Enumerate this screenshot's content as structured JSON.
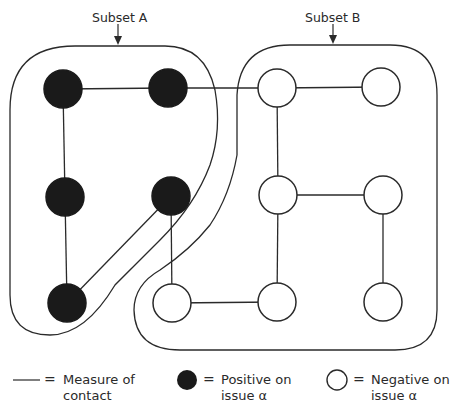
{
  "labels": {
    "subset_a": "Subset A",
    "subset_b": "Subset B"
  },
  "nodes": [
    {
      "id": 1,
      "x": 63,
      "y": 89,
      "state": "positive",
      "subset": "A"
    },
    {
      "id": 2,
      "x": 168,
      "y": 88,
      "state": "positive",
      "subset": "A"
    },
    {
      "id": 3,
      "x": 277,
      "y": 88,
      "state": "negative",
      "subset": "B"
    },
    {
      "id": 4,
      "x": 381,
      "y": 87,
      "state": "negative",
      "subset": "B"
    },
    {
      "id": 5,
      "x": 65,
      "y": 197,
      "state": "positive",
      "subset": "A"
    },
    {
      "id": 6,
      "x": 171,
      "y": 196,
      "state": "positive",
      "subset": "A"
    },
    {
      "id": 7,
      "x": 278,
      "y": 195,
      "state": "negative",
      "subset": "B"
    },
    {
      "id": 8,
      "x": 383,
      "y": 195,
      "state": "negative",
      "subset": "B"
    },
    {
      "id": 9,
      "x": 67,
      "y": 303,
      "state": "positive",
      "subset": "A"
    },
    {
      "id": 10,
      "x": 172,
      "y": 303,
      "state": "negative",
      "subset": "B"
    },
    {
      "id": 11,
      "x": 277,
      "y": 302,
      "state": "negative",
      "subset": "B"
    },
    {
      "id": 12,
      "x": 383,
      "y": 302,
      "state": "negative",
      "subset": "B"
    }
  ],
  "edges": [
    [
      1,
      2
    ],
    [
      2,
      3
    ],
    [
      3,
      4
    ],
    [
      1,
      5
    ],
    [
      5,
      9
    ],
    [
      6,
      9
    ],
    [
      3,
      7
    ],
    [
      7,
      8
    ],
    [
      7,
      11
    ],
    [
      8,
      12
    ],
    [
      6,
      10
    ],
    [
      10,
      11
    ]
  ],
  "legend": {
    "line_eq": "=",
    "line_text_1": "Measure of",
    "line_text_2": "contact",
    "positive_eq": "=",
    "positive_text_1": "Positive on",
    "positive_text_2": "issue α",
    "negative_eq": "=",
    "negative_text_1": "Negative on",
    "negative_text_2": "issue α"
  },
  "colors": {
    "positive_fill": "#1a1a1a",
    "negative_fill": "#ffffff",
    "stroke": "#2a2a2a"
  }
}
